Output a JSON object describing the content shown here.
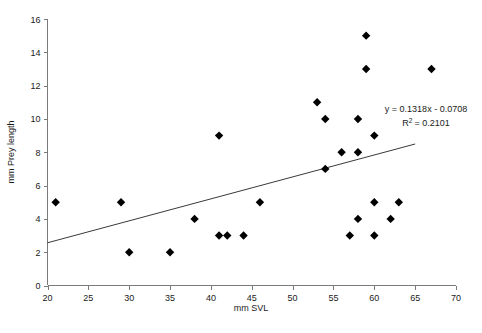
{
  "chart_data": {
    "type": "scatter",
    "title": "",
    "xlabel": "mm SVL",
    "ylabel": "mm Prey length",
    "xlim": [
      20,
      70
    ],
    "ylim": [
      0,
      16
    ],
    "xticks": [
      20,
      25,
      30,
      35,
      40,
      45,
      50,
      55,
      60,
      65,
      70
    ],
    "yticks": [
      0,
      2,
      4,
      6,
      8,
      10,
      12,
      14,
      16
    ],
    "xtick_labels": [
      "20",
      "25",
      "30",
      "35",
      "40",
      "45",
      "50",
      "55",
      "60",
      "65",
      "70"
    ],
    "ytick_labels": [
      "0",
      "2",
      "4",
      "6",
      "8",
      "10",
      "12",
      "14",
      "16"
    ],
    "grid": false,
    "legend": null,
    "marker": "diamond",
    "marker_color": "#000000",
    "points": [
      {
        "x": 21,
        "y": 5
      },
      {
        "x": 29,
        "y": 5
      },
      {
        "x": 30,
        "y": 2
      },
      {
        "x": 35,
        "y": 2
      },
      {
        "x": 38,
        "y": 4
      },
      {
        "x": 41,
        "y": 9
      },
      {
        "x": 41,
        "y": 3
      },
      {
        "x": 42,
        "y": 3
      },
      {
        "x": 44,
        "y": 3
      },
      {
        "x": 46,
        "y": 5
      },
      {
        "x": 53,
        "y": 11
      },
      {
        "x": 54,
        "y": 10
      },
      {
        "x": 54,
        "y": 7
      },
      {
        "x": 56,
        "y": 8
      },
      {
        "x": 57,
        "y": 3
      },
      {
        "x": 58,
        "y": 10
      },
      {
        "x": 58,
        "y": 8
      },
      {
        "x": 58,
        "y": 4
      },
      {
        "x": 59,
        "y": 15
      },
      {
        "x": 59,
        "y": 13
      },
      {
        "x": 60,
        "y": 9
      },
      {
        "x": 60,
        "y": 5
      },
      {
        "x": 60,
        "y": 3
      },
      {
        "x": 62,
        "y": 4
      },
      {
        "x": 63,
        "y": 5
      },
      {
        "x": 67,
        "y": 13
      }
    ],
    "trendline": {
      "equation": "y = 0.1318x - 0.0708",
      "r_squared_label": "R",
      "r_squared_exponent": "2",
      "r_squared_value": "= 0.2101",
      "slope": 0.1318,
      "intercept": -0.0708,
      "r2": 0.2101,
      "x_start": 20,
      "x_end": 65
    }
  }
}
